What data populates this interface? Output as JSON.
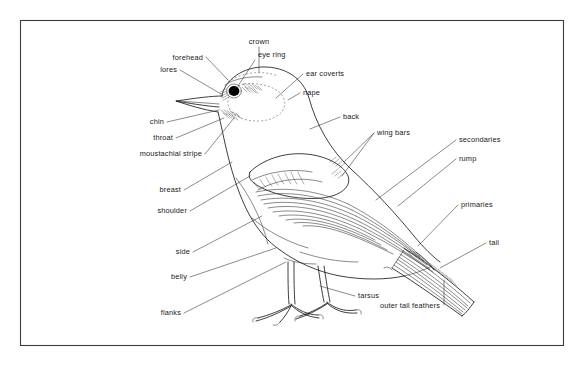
{
  "figure": {
    "background_color": "#ffffff",
    "ink_color": "#1c1c1c",
    "frame_color": "#3d3d3d"
  },
  "labels": {
    "crown": "crown",
    "forehead": "forehead",
    "lores": "lores",
    "eye_ring": "eye ring",
    "ear_coverts": "ear coverts",
    "nape": "nape",
    "chin": "chin",
    "throat": "throat",
    "moustachial_stripe": "moustachial stripe",
    "back": "back",
    "wing_bars": "wing bars",
    "secondaries": "secondaries",
    "rump": "rump",
    "primaries": "primaries",
    "breast": "breast",
    "shoulder": "shoulder",
    "side": "side",
    "belly": "belly",
    "flanks": "flanks",
    "tail": "tail",
    "tarsus": "tarsus",
    "outer_tail_feathers": "outer tail feathers"
  },
  "label_list": [
    "crown",
    "forehead",
    "lores",
    "eye ring",
    "ear coverts",
    "nape",
    "chin",
    "throat",
    "moustachial stripe",
    "back",
    "wing bars",
    "secondaries",
    "rump",
    "primaries",
    "breast",
    "shoulder",
    "side",
    "belly",
    "flanks",
    "tail",
    "tarsus",
    "outer tail feathers"
  ]
}
